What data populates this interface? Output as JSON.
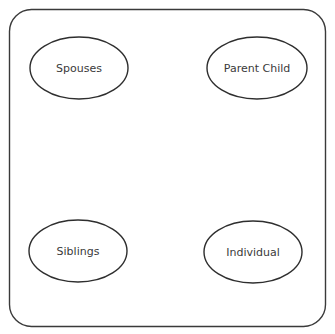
{
  "diagram": {
    "frame": {
      "x": 9.5,
      "y": 9.5,
      "width": 316,
      "height": 317,
      "radius": 22
    },
    "nodes": [
      {
        "label": "Spouses",
        "cx": 79,
        "cy": 68,
        "rx": 49,
        "ry": 31
      },
      {
        "label": "Parent Child",
        "cx": 257,
        "cy": 68,
        "rx": 50,
        "ry": 31
      },
      {
        "label": "Siblings",
        "cx": 78,
        "cy": 251,
        "rx": 49,
        "ry": 31
      },
      {
        "label": "Individual",
        "cx": 253,
        "cy": 252,
        "rx": 49,
        "ry": 31
      }
    ]
  }
}
